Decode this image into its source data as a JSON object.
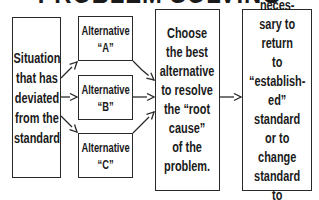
{
  "title": "PROBLEM SOLVING",
  "nodes": {
    "situation": "Situation\nthat has\ndeviated\nfrom the\nstandard",
    "alternatives": [
      "Alternative\n“A”",
      "Alternative\n“B”",
      "Alternative\n“C”"
    ],
    "choose": "Choose\nthe best\nalternative\nto resolve\nthe “root\ncause”\nof the\nproblem.",
    "course": "Course of\naction neces-\nsary to return\nto “establish-\ned” standard\nor to change\nstandard to\npresent\nreality."
  },
  "edges": [
    {
      "from": "situation",
      "to": "alternative-a"
    },
    {
      "from": "situation",
      "to": "alternative-b"
    },
    {
      "from": "situation",
      "to": "alternative-c"
    },
    {
      "from": "alternative-a",
      "to": "choose"
    },
    {
      "from": "alternative-b",
      "to": "choose"
    },
    {
      "from": "alternative-c",
      "to": "choose"
    },
    {
      "from": "choose",
      "to": "course"
    }
  ],
  "colors": {
    "line": "#2a2a2a",
    "background": "#ffffff"
  }
}
